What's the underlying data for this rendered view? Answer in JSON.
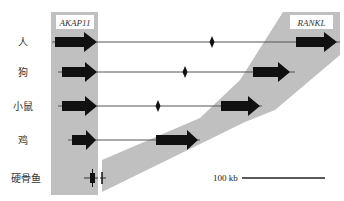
{
  "figure": {
    "genes": {
      "left": "AKAP11",
      "right": "RANKL"
    },
    "species": [
      {
        "key": "human",
        "label": "人",
        "has_left_gene": true,
        "has_right_gene": true,
        "has_marker": true
      },
      {
        "key": "dog",
        "label": "狗",
        "has_left_gene": true,
        "has_right_gene": true,
        "has_marker": true
      },
      {
        "key": "mouse",
        "label": "小鼠",
        "has_left_gene": true,
        "has_right_gene": true,
        "has_marker": true
      },
      {
        "key": "chicken",
        "label": "鸡",
        "has_left_gene": true,
        "has_right_gene": true,
        "has_marker": false
      },
      {
        "key": "teleost",
        "label": "硬骨鱼",
        "has_left_gene": true,
        "has_right_gene": false,
        "has_marker": false
      }
    ],
    "scale_bar": {
      "label": "100 kb"
    },
    "colors": {
      "synteny_band": "#c0c0c0",
      "gene_arrow": "#111111",
      "chromosome_line": "#555555",
      "label_box": "#ffffff"
    }
  }
}
